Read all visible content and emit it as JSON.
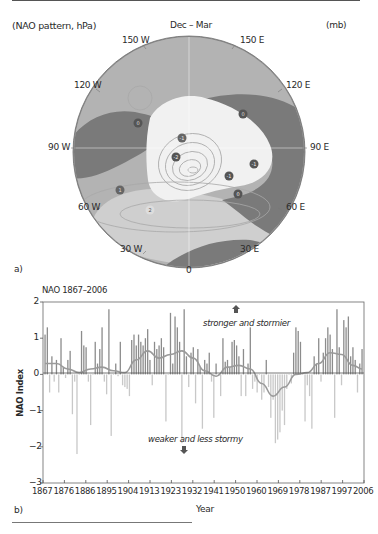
{
  "map": {
    "title": "(NAO pattern, hPa)",
    "season": "Dec – Mar",
    "unit": "(mb)",
    "panel_label": "a)",
    "longitudes": {
      "lon_150w": "150 W",
      "lon_120w": "120 W",
      "lon_90w": "90 W",
      "lon_60w": "60 W",
      "lon_30w": "30 W",
      "lon_0": "0",
      "lon_30e": "30 E",
      "lon_60e": "60 E",
      "lon_90e": "90 E",
      "lon_120e": "120 E",
      "lon_150e": "150 E"
    },
    "pressure_markers": [
      {
        "label": "0",
        "sign": "neutral"
      },
      {
        "label": "0",
        "sign": "neutral"
      },
      {
        "label": "-1",
        "sign": "negative"
      },
      {
        "label": "-2",
        "sign": "negative"
      },
      {
        "label": "-1",
        "sign": "negative"
      },
      {
        "label": "-1",
        "sign": "negative"
      },
      {
        "label": "0",
        "sign": "neutral"
      },
      {
        "label": "1",
        "sign": "positive"
      },
      {
        "label": "2",
        "sign": "positive"
      }
    ],
    "colors": {
      "ocean": "#b4b4b4",
      "land": "#7d7d7d",
      "negative_region": "#f2f2f2",
      "positive_region": "#d2d2d2",
      "rim": "#8a8a8a"
    }
  },
  "chart": {
    "title": "NAO 1867–2006",
    "panel_label": "b)",
    "ylabel": "NAO Index",
    "xlabel": "Year",
    "annotation_up": "stronger and stormier",
    "annotation_down": "weaker and less stormy",
    "y_ticks": [
      "2",
      "1",
      "0",
      "−1",
      "−2",
      "−3"
    ],
    "x_ticks": [
      "1867",
      "1876",
      "1886",
      "1895",
      "1904",
      "1913",
      "1923",
      "1932",
      "1941",
      "1950",
      "1960",
      "1969",
      "1978",
      "1987",
      "1997",
      "2006"
    ]
  },
  "chart_data": {
    "type": "bar",
    "title": "NAO 1867–2006",
    "xlabel": "Year",
    "ylabel": "NAO Index",
    "ylim": [
      -3,
      2
    ],
    "xlim": [
      1867,
      2006
    ],
    "grid": false,
    "annotations": [
      "stronger and stormier",
      "weaker and less stormy"
    ],
    "x": [
      1867,
      1868,
      1869,
      1870,
      1871,
      1872,
      1873,
      1874,
      1875,
      1876,
      1877,
      1878,
      1879,
      1880,
      1881,
      1882,
      1883,
      1884,
      1885,
      1886,
      1887,
      1888,
      1889,
      1890,
      1891,
      1892,
      1893,
      1894,
      1895,
      1896,
      1897,
      1898,
      1899,
      1900,
      1901,
      1902,
      1903,
      1904,
      1905,
      1906,
      1907,
      1908,
      1909,
      1910,
      1911,
      1912,
      1913,
      1914,
      1915,
      1916,
      1917,
      1918,
      1919,
      1920,
      1921,
      1922,
      1923,
      1924,
      1925,
      1926,
      1927,
      1928,
      1929,
      1930,
      1931,
      1932,
      1933,
      1934,
      1935,
      1936,
      1937,
      1938,
      1939,
      1940,
      1941,
      1942,
      1943,
      1944,
      1945,
      1946,
      1947,
      1948,
      1949,
      1950,
      1951,
      1952,
      1953,
      1954,
      1955,
      1956,
      1957,
      1958,
      1959,
      1960,
      1961,
      1962,
      1963,
      1964,
      1965,
      1966,
      1967,
      1968,
      1969,
      1970,
      1971,
      1972,
      1973,
      1974,
      1975,
      1976,
      1977,
      1978,
      1979,
      1980,
      1981,
      1982,
      1983,
      1984,
      1985,
      1986,
      1987,
      1988,
      1989,
      1990,
      1991,
      1992,
      1993,
      1994,
      1995,
      1996,
      1997,
      1998,
      1999,
      2000,
      2001,
      2002,
      2003,
      2004,
      2005,
      2006
    ],
    "series": [
      {
        "name": "Annual NAO index",
        "values": [
          1.1,
          1.3,
          -0.5,
          0.5,
          -0.2,
          0.4,
          -0.5,
          1.0,
          0.2,
          -0.1,
          0.4,
          0.65,
          -1.1,
          -0.2,
          -2.2,
          0.0,
          1.2,
          0.8,
          0.75,
          -0.2,
          -1.4,
          0.0,
          0.9,
          0.3,
          0.7,
          1.3,
          -0.2,
          -0.55,
          1.8,
          -1.7,
          0.0,
          0.3,
          -0.05,
          0.9,
          -0.3,
          -0.35,
          -0.4,
          -0.6,
          0.95,
          1.1,
          0.8,
          1.1,
          0.9,
          0.8,
          1.0,
          1.25,
          0.4,
          -0.3,
          0.9,
          0.7,
          0.8,
          1.0,
          0.75,
          -1.3,
          0.0,
          1.7,
          0.3,
          1.6,
          1.3,
          0.9,
          -1.9,
          1.8,
          0.5,
          -0.35,
          0.6,
          0.75,
          -0.8,
          0.7,
          0.2,
          -1.5,
          0.4,
          0.3,
          0.6,
          -0.2,
          -1.2,
          0.3,
          0.0,
          -0.6,
          1.0,
          0.35,
          0.4,
          0.2,
          0.9,
          0.95,
          0.8,
          0.5,
          -0.6,
          0.7,
          -0.6,
          0.3,
          1.3,
          -0.4,
          -0.2,
          -0.5,
          0.0,
          -0.7,
          -0.5,
          0.4,
          -0.35,
          -1.2,
          -0.7,
          -1.9,
          -1.8,
          -1.6,
          -1.0,
          -1.4,
          -0.4,
          0.0,
          -0.25,
          0.6,
          1.3,
          1.2,
          0.9,
          0.0,
          -1.3,
          -0.3,
          -0.6,
          -1.5,
          0.5,
          0.3,
          1.0,
          -0.2,
          0.6,
          1.0,
          1.3,
          1.1,
          0.7,
          -1.2,
          1.8,
          0.75,
          -0.3,
          1.5,
          1.3,
          1.6,
          0.5,
          0.75,
          0.4,
          -0.5,
          0.3,
          0.7
        ]
      },
      {
        "name": "Smoothed (decadal)",
        "x": [
          1867,
          1872,
          1877,
          1882,
          1887,
          1892,
          1897,
          1902,
          1907,
          1912,
          1917,
          1922,
          1927,
          1932,
          1937,
          1942,
          1947,
          1952,
          1957,
          1962,
          1967,
          1972,
          1977,
          1982,
          1987,
          1992,
          1997,
          2002,
          2006
        ],
        "values": [
          0.3,
          0.3,
          0.15,
          0.05,
          0.15,
          0.2,
          0.1,
          0.05,
          0.4,
          0.65,
          0.45,
          0.55,
          0.65,
          0.45,
          0.1,
          -0.05,
          0.2,
          0.25,
          0.15,
          -0.25,
          -0.6,
          -0.35,
          0.0,
          0.05,
          0.3,
          0.6,
          0.55,
          0.25,
          0.15
        ]
      }
    ]
  }
}
